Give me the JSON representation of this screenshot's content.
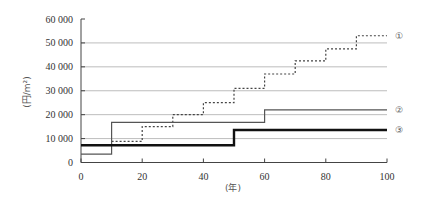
{
  "chart_data": {
    "type": "line",
    "subtype": "step",
    "title": "",
    "xlabel": "(年)",
    "ylabel": "(円/m²)",
    "xlim": [
      0,
      100
    ],
    "ylim": [
      0,
      60000
    ],
    "x_ticks": [
      0,
      20,
      40,
      60,
      80,
      100
    ],
    "x_tick_labels": [
      "0",
      "20",
      "40",
      "60",
      "80",
      "100"
    ],
    "y_ticks": [
      0,
      10000,
      20000,
      30000,
      40000,
      50000,
      60000
    ],
    "y_tick_labels": [
      "0",
      "10 000",
      "20 000",
      "30 000",
      "40 000",
      "50 000",
      "60 000"
    ],
    "grid": "horizontal",
    "legend": "inline-right",
    "series": [
      {
        "name": "①",
        "style": "dotted",
        "color": "#444444",
        "steps": [
          {
            "x_start": 10,
            "x_end": 20,
            "value": 8800
          },
          {
            "x_start": 20,
            "x_end": 30,
            "value": 15000
          },
          {
            "x_start": 30,
            "x_end": 40,
            "value": 20000
          },
          {
            "x_start": 40,
            "x_end": 50,
            "value": 25000
          },
          {
            "x_start": 50,
            "x_end": 60,
            "value": 31000
          },
          {
            "x_start": 60,
            "x_end": 70,
            "value": 37000
          },
          {
            "x_start": 70,
            "x_end": 80,
            "value": 42500
          },
          {
            "x_start": 80,
            "x_end": 90,
            "value": 47500
          },
          {
            "x_start": 90,
            "x_end": 100,
            "value": 53000
          }
        ]
      },
      {
        "name": "②",
        "style": "solid-thin",
        "color": "#555555",
        "steps": [
          {
            "x_start": 0,
            "x_end": 10,
            "value": 3500
          },
          {
            "x_start": 10,
            "x_end": 60,
            "value": 16800
          },
          {
            "x_start": 60,
            "x_end": 100,
            "value": 22000
          }
        ]
      },
      {
        "name": "③",
        "style": "solid-thick",
        "color": "#111111",
        "steps": [
          {
            "x_start": 0,
            "x_end": 50,
            "value": 7200
          },
          {
            "x_start": 50,
            "x_end": 100,
            "value": 13600
          }
        ]
      }
    ]
  }
}
